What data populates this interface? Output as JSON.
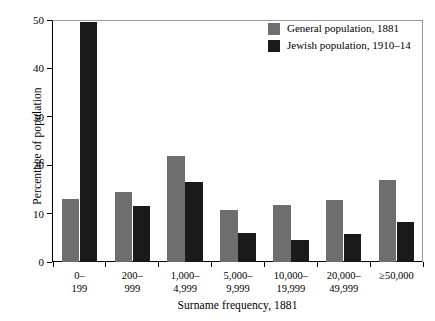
{
  "chart_data": {
    "type": "bar",
    "title": "",
    "xlabel": "Surname frequency, 1881",
    "ylabel": "Percentage of population",
    "ylim": [
      0,
      50
    ],
    "yticks": [
      0,
      10,
      20,
      30,
      40,
      50
    ],
    "ytick_labels": [
      "0",
      "10",
      "20",
      "30",
      "40",
      "50"
    ],
    "grid": false,
    "legend_position": "top-right",
    "categories": [
      "0–\n199",
      "200–\n999",
      "1,000–\n4,999",
      "5,000–\n9,999",
      "10,000–\n19,999",
      "20,000–\n49,999",
      "≥50,000"
    ],
    "category_lines": [
      [
        "0–",
        "199"
      ],
      [
        "200–",
        "999"
      ],
      [
        "1,000–",
        "4,999"
      ],
      [
        "5,000–",
        "9,999"
      ],
      [
        "10,000–",
        "19,999"
      ],
      [
        "20,000–",
        "49,999"
      ],
      [
        "≥50,000",
        ""
      ]
    ],
    "series": [
      {
        "name": "General population, 1881",
        "color": "#6e6e6e",
        "values": [
          13.0,
          14.4,
          22.0,
          10.8,
          11.8,
          12.8,
          17.0
        ]
      },
      {
        "name": "Jewish population, 1910–14",
        "color": "#1a1a1a",
        "values": [
          49.5,
          11.5,
          16.5,
          6.0,
          4.6,
          5.8,
          8.3
        ]
      }
    ]
  },
  "legend": {
    "items": [
      {
        "label": "General population, 1881",
        "color": "#6e6e6e"
      },
      {
        "label": "Jewish population, 1910–14",
        "color": "#1a1a1a"
      }
    ]
  }
}
